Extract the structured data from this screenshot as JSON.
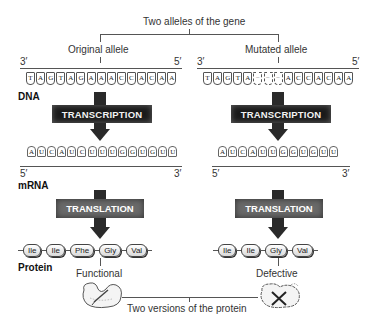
{
  "title": "Two alleles of the gene",
  "bottom_caption": "Two versions of the protein",
  "row_labels": {
    "dna": "DNA",
    "mrna": "mRNA",
    "protein": "Protein"
  },
  "colors": {
    "process_box_dark": "#1a1a1a",
    "process_box_gray": "#6a6a6a",
    "line": "#555555"
  },
  "original": {
    "label": "Original allele",
    "dna_end_left": "3′",
    "dna_end_right": "5′",
    "dna_bases": [
      "T",
      "A",
      "G",
      "T",
      "A",
      "G",
      "A",
      "A",
      "A",
      "C",
      "C",
      "A",
      "C",
      "A",
      "A"
    ],
    "transcription_label": "TRANSCRIPTION",
    "mrna_bases": [
      "A",
      "U",
      "C",
      "A",
      "U",
      "C",
      "U",
      "U",
      "U",
      "G",
      "G",
      "U",
      "G",
      "U",
      "U"
    ],
    "mrna_end_left": "5′",
    "mrna_end_right": "3′",
    "translation_label": "TRANSLATION",
    "amino_acids": [
      "Ile",
      "Ile",
      "Phe",
      "Gly",
      "Val"
    ],
    "outcome": "Functional",
    "protein_icon": "functional-protein-icon"
  },
  "mutated": {
    "label": "Mutated allele",
    "dna_end_left": "3′",
    "dna_end_right": "5′",
    "dna_bases": [
      "T",
      "A",
      "G",
      "T",
      "A",
      "−",
      "−",
      "−",
      "A",
      "C",
      "C",
      "A",
      "C",
      "A",
      "A"
    ],
    "transcription_label": "TRANSCRIPTION",
    "mrna_bases": [
      "A",
      "U",
      "C",
      "A",
      "U",
      "U",
      "G",
      "G",
      "U",
      "G",
      "U",
      "U"
    ],
    "mrna_end_left": "5′",
    "mrna_end_right": "3′",
    "translation_label": "TRANSLATION",
    "amino_acids": [
      "Ile",
      "Ile",
      "Gly",
      "Val"
    ],
    "outcome": "Defective",
    "protein_icon": "defective-protein-icon"
  }
}
